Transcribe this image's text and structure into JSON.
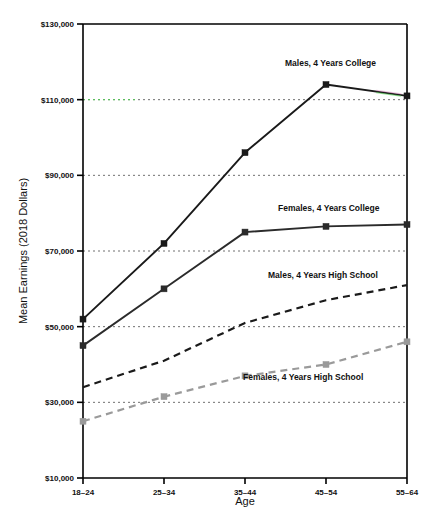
{
  "chart_data": {
    "type": "line",
    "title": "",
    "xlabel": "Age",
    "ylabel": "Mean Earnings (2018 Dollars)",
    "categories": [
      "18–24",
      "25–34",
      "35–44",
      "45–54",
      "55–64"
    ],
    "ylim": [
      10000,
      130000
    ],
    "ytick_values": [
      10000,
      30000,
      50000,
      70000,
      90000,
      110000,
      130000
    ],
    "ytick_labels": [
      "$10,000",
      "$30,000",
      "$50,000",
      "$70,000",
      "$90,000",
      "$110,000",
      "$130,000"
    ],
    "grid": "horizontal-dotted",
    "legend": "inline-labels",
    "series": [
      {
        "name": "Males, 4 Years College",
        "values": [
          52000,
          72000,
          96000,
          114000,
          111000
        ],
        "style": "solid",
        "color": "#1a1a1a",
        "marker": "square",
        "label_x": 285,
        "label_y": 66
      },
      {
        "name": "Females, 4 Years College",
        "values": [
          45000,
          60000,
          75000,
          76500,
          77000
        ],
        "style": "solid",
        "color": "#2b2b2b",
        "marker": "square",
        "label_x": 278,
        "label_y": 211
      },
      {
        "name": "Males, 4 Years High School",
        "values": [
          34000,
          41000,
          51000,
          57000,
          61000
        ],
        "style": "dashed",
        "color": "#1a1a1a",
        "marker": "none",
        "label_x": 268,
        "label_y": 278
      },
      {
        "name": "Females, 4 Years High School",
        "values": [
          25000,
          31500,
          37000,
          40000,
          46000
        ],
        "style": "dashed",
        "color": "#9a9a9a",
        "marker": "square",
        "label_x": 243,
        "label_y": 380
      }
    ],
    "accent_highlight_color": "#4fd04f",
    "gridline_color": "#707070",
    "axis_color": "#000000",
    "background": "#ffffff"
  }
}
